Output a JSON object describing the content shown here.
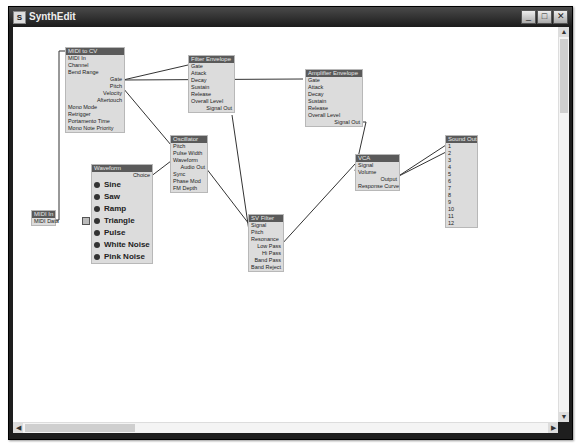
{
  "window": {
    "title": "SynthEdit",
    "buttons": [
      "_",
      "□",
      "✕"
    ]
  },
  "modules": {
    "midi_to_cv": {
      "title": "MIDI to CV",
      "inputs": [
        "MIDI In",
        "Channel",
        "Bend Range"
      ],
      "outputs": [
        "Gate",
        "Pitch",
        "Velocity",
        "Aftertouch"
      ],
      "extra_inputs": [
        "Mono Mode",
        "Retrigger",
        "Portamento Time",
        "Mono Note Priority"
      ]
    },
    "filter_envelope": {
      "title": "Filter Envelope",
      "inputs": [
        "Gate",
        "Attack",
        "Decay",
        "Sustain",
        "Release",
        "Overall Level"
      ],
      "outputs": [
        "Signal Out"
      ]
    },
    "amplifier_envelope": {
      "title": "Amplifier Envelope",
      "inputs": [
        "Gate",
        "Attack",
        "Decay",
        "Sustain",
        "Release",
        "Overall Level"
      ],
      "outputs": [
        "Signal Out"
      ]
    },
    "oscillator": {
      "title": "Oscillator",
      "inputs": [
        "Pitch",
        "Pulse Width",
        "Waveform"
      ],
      "outputs": [
        "Audio Out"
      ],
      "extra_inputs": [
        "Sync",
        "Phase Mod",
        "FM Depth"
      ]
    },
    "waveform": {
      "title": "Waveform",
      "output": "Choice",
      "options": [
        "Sine",
        "Saw",
        "Ramp",
        "Triangle",
        "Pulse",
        "White Noise",
        "Pink Noise"
      ],
      "selected": "Triangle"
    },
    "sv_filter": {
      "title": "SV Filter",
      "inputs": [
        "Signal",
        "Pitch",
        "Resonance"
      ],
      "outputs": [
        "Low Pass",
        "Hi Pass",
        "Band Pass",
        "Band Reject"
      ]
    },
    "vca": {
      "title": "VCA",
      "inputs": [
        "Signal",
        "Volume"
      ],
      "outputs": [
        "Output"
      ],
      "extra_inputs": [
        "Response Curve"
      ]
    },
    "sound_out": {
      "title": "Sound Out",
      "inputs": [
        "1",
        "2",
        "3",
        "4",
        "5",
        "6",
        "7",
        "8",
        "9",
        "10",
        "11",
        "12"
      ]
    },
    "midi_in": {
      "title": "MIDI In",
      "outputs": [
        "MIDI Data"
      ]
    }
  },
  "scrollbars": {
    "up": "▲",
    "down": "▼",
    "left": "◀",
    "right": "▶"
  }
}
